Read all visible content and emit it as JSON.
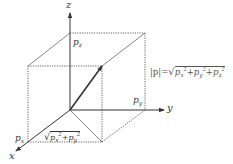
{
  "diagram": {
    "type": "3d-vector-decomposition",
    "axes": {
      "x_label": "x",
      "y_label": "y",
      "z_label": "z"
    },
    "components": {
      "px": {
        "base": "p",
        "sub": "x"
      },
      "py": {
        "base": "p",
        "sub": "y"
      },
      "pz": {
        "base": "p",
        "sub": "z"
      }
    },
    "formulas": {
      "magnitude": {
        "lhs": "|p|",
        "eq": "=",
        "sqrt": "√",
        "terms": [
          {
            "base": "p",
            "sub": "x",
            "sup": "2"
          },
          {
            "op": "+"
          },
          {
            "base": "p",
            "sub": "y",
            "sup": "2"
          },
          {
            "op": "+"
          },
          {
            "base": "p",
            "sub": "z",
            "sup": "2"
          }
        ]
      },
      "planar": {
        "sqrt": "√",
        "terms": [
          {
            "base": "p",
            "sub": "x",
            "sup": "2"
          },
          {
            "op": "+"
          },
          {
            "base": "p",
            "sub": "y",
            "sup": "2"
          }
        ]
      }
    },
    "colors": {
      "stroke": "#333333",
      "dotted": "#555555",
      "text": "#333333",
      "formula_text": "#555555"
    }
  }
}
